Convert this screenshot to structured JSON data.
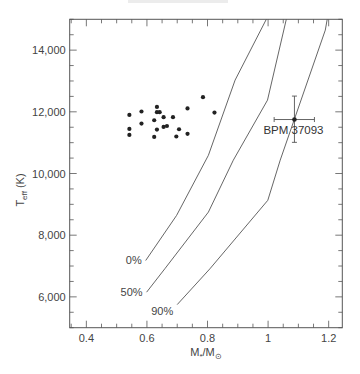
{
  "chart_data": {
    "type": "scatter",
    "title": "",
    "xlabel": "M*/M⊙",
    "xlabel_main": "M",
    "xlabel_sub1": "*",
    "xlabel_mid": "/M",
    "xlabel_sub2": "⊙",
    "ylabel": "T_eff (K)",
    "ylabel_main": "T",
    "ylabel_sub": "eff",
    "ylabel_unit": " (K)",
    "xlim": [
      0.345,
      1.245
    ],
    "ylim": [
      5000,
      15000
    ],
    "grid": false,
    "x_ticks": [
      0.4,
      0.6,
      0.8,
      1.0,
      1.2
    ],
    "x_tick_labels": [
      "0.4",
      "0.6",
      "0.8",
      "1",
      "1.2"
    ],
    "y_ticks": [
      6000,
      8000,
      10000,
      12000,
      14000
    ],
    "y_tick_labels": [
      "6,000",
      "8,000",
      "10,000",
      "12,000",
      "14,000"
    ],
    "series": [
      {
        "name": "White dwarfs",
        "kind": "scatter",
        "points": [
          [
            0.542,
            11900
          ],
          [
            0.582,
            12010
          ],
          [
            0.582,
            11620
          ],
          [
            0.542,
            11445
          ],
          [
            0.542,
            11250
          ],
          [
            0.624,
            11727
          ],
          [
            0.633,
            12160
          ],
          [
            0.633,
            11987
          ],
          [
            0.642,
            11987
          ],
          [
            0.624,
            11185
          ],
          [
            0.633,
            11425
          ],
          [
            0.655,
            11825
          ],
          [
            0.655,
            11510
          ],
          [
            0.666,
            11540
          ],
          [
            0.686,
            11825
          ],
          [
            0.706,
            11435
          ],
          [
            0.697,
            11200
          ],
          [
            0.734,
            12110
          ],
          [
            0.734,
            11285
          ],
          [
            0.785,
            12475
          ],
          [
            0.823,
            11977
          ]
        ]
      },
      {
        "name": "BPM 37093",
        "kind": "point_with_errorbars",
        "label": "BPM 37093",
        "x": 1.087,
        "y": 11750,
        "x_err": [
          1.02,
          1.153
        ],
        "y_err": [
          11010,
          12510
        ]
      },
      {
        "name": "0%",
        "kind": "line",
        "label": "0%",
        "points": [
          [
            0.596,
            7180
          ],
          [
            0.698,
            8640
          ],
          [
            0.803,
            10590
          ],
          [
            0.891,
            13030
          ],
          [
            0.994,
            15000
          ]
        ]
      },
      {
        "name": "50%",
        "kind": "line",
        "label": "50%",
        "points": [
          [
            0.599,
            6150
          ],
          [
            0.659,
            6910
          ],
          [
            0.803,
            8750
          ],
          [
            0.885,
            10430
          ],
          [
            0.998,
            12380
          ],
          [
            1.06,
            15000
          ]
        ]
      },
      {
        "name": "90%",
        "kind": "line",
        "label": "90%",
        "points": [
          [
            0.7,
            5750
          ],
          [
            0.808,
            6910
          ],
          [
            0.999,
            9130
          ],
          [
            1.04,
            10430
          ],
          [
            1.189,
            14650
          ],
          [
            1.195,
            15000
          ]
        ]
      }
    ]
  }
}
